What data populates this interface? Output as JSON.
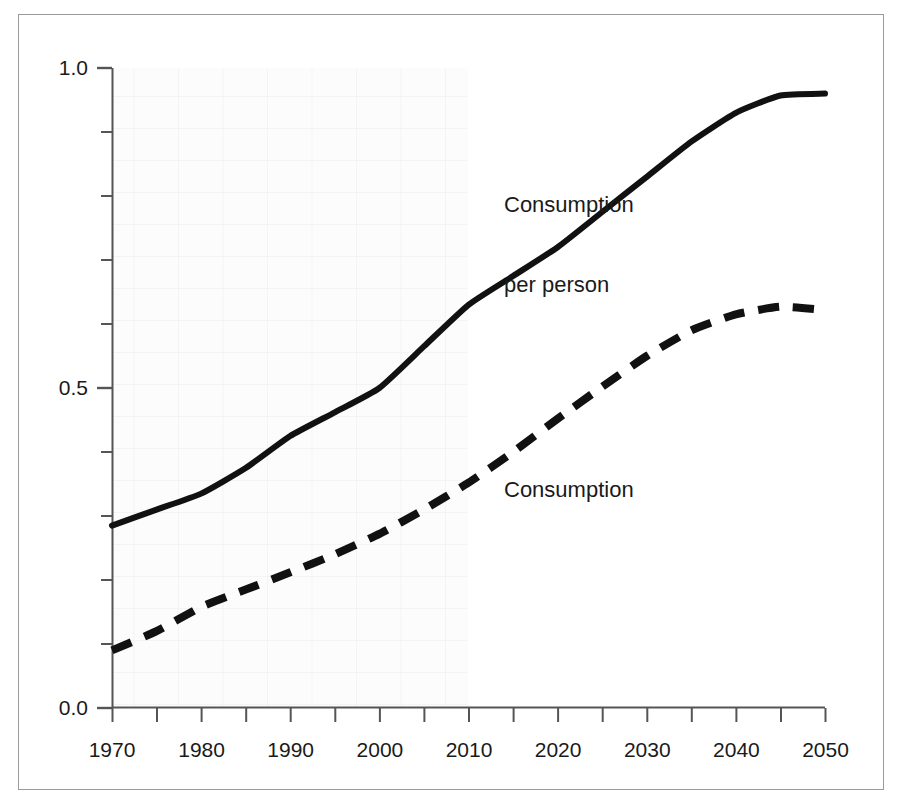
{
  "chart_data": {
    "type": "line",
    "title": "",
    "subtitle": "",
    "xlabel": "",
    "ylabel": "",
    "xlim": [
      1970,
      2050
    ],
    "ylim": [
      0.0,
      1.0
    ],
    "grid": true,
    "grid_note": "faint light-grey graph-paper grid visible over left/upper plot area",
    "legend_position": "inline-annotation",
    "x_tick_labels": [
      "1970",
      "1980",
      "1990",
      "2000",
      "2010",
      "2020",
      "2030",
      "2040",
      "2050"
    ],
    "x_ticks": [
      1970,
      1980,
      1990,
      2000,
      2010,
      2020,
      2030,
      2040,
      2050
    ],
    "x_minor_ticks": [
      1975,
      1985,
      1995,
      2005,
      2015,
      2025,
      2035,
      2045
    ],
    "y_tick_labels": [
      "0.0",
      "0.5",
      "1.0"
    ],
    "y_ticks": [
      0.0,
      0.5,
      1.0
    ],
    "y_minor_ticks": [
      0.1,
      0.2,
      0.3,
      0.4,
      0.6,
      0.7,
      0.8,
      0.9
    ],
    "x": [
      1970,
      1975,
      1980,
      1985,
      1990,
      1995,
      2000,
      2005,
      2010,
      2015,
      2020,
      2025,
      2030,
      2035,
      2040,
      2045,
      2050
    ],
    "series": [
      {
        "name": "Consumption per person",
        "style": "solid",
        "color": "#111111",
        "width": 6,
        "values": [
          0.285,
          0.31,
          0.335,
          0.375,
          0.425,
          0.462,
          0.5,
          0.565,
          0.63,
          0.675,
          0.72,
          0.775,
          0.83,
          0.885,
          0.93,
          0.957,
          0.96
        ]
      },
      {
        "name": "Consumption",
        "style": "dashed",
        "color": "#111111",
        "width": 8,
        "values": [
          0.09,
          0.12,
          0.158,
          0.185,
          0.212,
          0.24,
          0.272,
          0.31,
          0.352,
          0.4,
          0.452,
          0.502,
          0.55,
          0.59,
          0.615,
          0.627,
          0.622
        ]
      }
    ],
    "annotations": [
      {
        "text": "Consumption\nper person",
        "x": 2008,
        "y": 0.855,
        "series": "Consumption per person"
      },
      {
        "text": "Consumption",
        "x": 2008,
        "y": 0.33,
        "series": "Consumption"
      }
    ]
  },
  "annotations": {
    "consumption_per_person_line1": "Consumption",
    "consumption_per_person_line2": "per person",
    "consumption": "Consumption"
  },
  "colors": {
    "line": "#111111",
    "axis": "#555555",
    "grid": "#eeeeee",
    "frame": "#9a9a9a",
    "background": "#ffffff",
    "text": "#1a1a1a"
  }
}
